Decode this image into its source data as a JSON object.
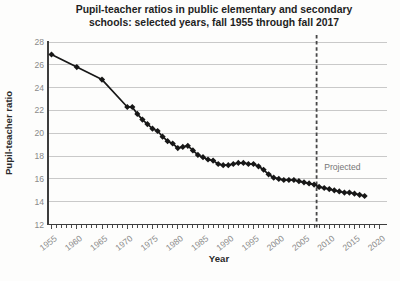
{
  "page": {
    "background": "#fdfdfc"
  },
  "chart": {
    "title_line1": "Pupil-teacher ratios in public elementary and secondary",
    "title_line2": "schools: selected years, fall 1955 through fall 2017",
    "y_axis_title": "Pupil-teacher ratio",
    "x_axis_title": "Year",
    "projected_label": "Projected",
    "colors": {
      "series_line": "#171717",
      "marker": "#171717",
      "gridline": "#c9c9c9",
      "axis_line": "#3d3d3d",
      "tick_mark": "#4a4a4a",
      "tick_label": "#8a8a8a",
      "divider_line": "#474747",
      "projected_text": "#767676",
      "title_text": "#1f1f1f"
    }
  },
  "chart_data": {
    "type": "line",
    "title": "Pupil-teacher ratios in public elementary and secondary schools: selected years, fall 1955 through fall 2017",
    "xlabel": "Year",
    "ylabel": "Pupil-teacher ratio",
    "ylim": [
      12,
      28
    ],
    "y_ticks": [
      12,
      14,
      16,
      18,
      20,
      22,
      24,
      26,
      28
    ],
    "x_axis_range": [
      1955,
      2020
    ],
    "x_tick_label_years": [
      1955,
      1960,
      1965,
      1970,
      1975,
      1980,
      1985,
      1990,
      1995,
      2000,
      2005,
      2010,
      2015,
      2020
    ],
    "x_minor_tick_step": 1,
    "grid": "horizontal",
    "legend": "none",
    "divider_year": 2007.5,
    "annotation": {
      "label": "Projected",
      "x_year": 2009,
      "y_value": 16.75
    },
    "series": [
      {
        "name": "Pupil-teacher ratio",
        "marker": "diamond",
        "points": [
          [
            1955,
            26.9
          ],
          [
            1960,
            25.8
          ],
          [
            1965,
            24.7
          ],
          [
            1970,
            22.3
          ],
          [
            1971,
            22.3
          ],
          [
            1972,
            21.7
          ],
          [
            1973,
            21.2
          ],
          [
            1974,
            20.8
          ],
          [
            1975,
            20.4
          ],
          [
            1976,
            20.2
          ],
          [
            1977,
            19.7
          ],
          [
            1978,
            19.3
          ],
          [
            1979,
            19.1
          ],
          [
            1980,
            18.7
          ],
          [
            1981,
            18.8
          ],
          [
            1982,
            18.9
          ],
          [
            1983,
            18.5
          ],
          [
            1984,
            18.1
          ],
          [
            1985,
            17.9
          ],
          [
            1986,
            17.7
          ],
          [
            1987,
            17.6
          ],
          [
            1988,
            17.3
          ],
          [
            1989,
            17.2
          ],
          [
            1990,
            17.2
          ],
          [
            1991,
            17.3
          ],
          [
            1992,
            17.4
          ],
          [
            1993,
            17.4
          ],
          [
            1994,
            17.3
          ],
          [
            1995,
            17.3
          ],
          [
            1996,
            17.1
          ],
          [
            1997,
            16.8
          ],
          [
            1998,
            16.4
          ],
          [
            1999,
            16.1
          ],
          [
            2000,
            16.0
          ],
          [
            2001,
            15.9
          ],
          [
            2002,
            15.9
          ],
          [
            2003,
            15.9
          ],
          [
            2004,
            15.8
          ],
          [
            2005,
            15.7
          ],
          [
            2006,
            15.6
          ],
          [
            2007,
            15.5
          ],
          [
            2008,
            15.3
          ],
          [
            2009,
            15.2
          ],
          [
            2010,
            15.1
          ],
          [
            2011,
            15.0
          ],
          [
            2012,
            14.9
          ],
          [
            2013,
            14.8
          ],
          [
            2014,
            14.8
          ],
          [
            2015,
            14.7
          ],
          [
            2016,
            14.6
          ],
          [
            2017,
            14.5
          ]
        ]
      }
    ]
  }
}
